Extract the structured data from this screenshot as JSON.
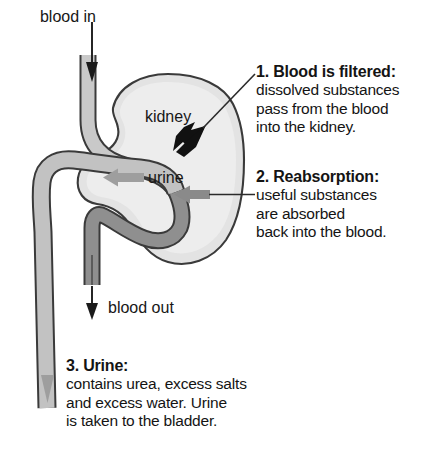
{
  "diagram": {
    "title_semantic": "kidney-blood-filtration-diagram",
    "labels": {
      "blood_in": "blood in",
      "blood_out": "blood out",
      "kidney": "kidney",
      "urine": "urine"
    },
    "colors": {
      "background": "#ffffff",
      "kidney_fill": "#e3e3e3",
      "kidney_inner_fill": "#ededed",
      "artery_fill": "#c9c9c9",
      "vein_fill": "#8f8f8f",
      "urine_tube_fill": "#c2c2c2",
      "outline": "#3a3a3a",
      "filter_arrow": "#111111",
      "reabsorption_arrow": "#8a8a8a",
      "urine_arrow": "#9e9e9e",
      "text": "#141414",
      "leader_line": "#2b2b2b"
    },
    "icons": {
      "blood_in_arrow": "arrow-down-icon",
      "blood_out_arrow": "arrow-down-icon",
      "urine_flow_arrow": "arrow-left-icon",
      "filtration_arrow": "arrow-up-right-icon",
      "reabsorption_arrow": "arrow-left-icon",
      "urine_outflow_arrow": "arrow-down-icon"
    }
  },
  "callouts": [
    {
      "id": "blood-filtered",
      "heading": "1. Blood is filtered:",
      "lines": [
        "dissolved substances",
        "pass from the blood",
        "into the kidney."
      ]
    },
    {
      "id": "reabsorption",
      "heading": "2. Reabsorption:",
      "lines": [
        "useful substances",
        "are absorbed",
        "back into the blood."
      ]
    },
    {
      "id": "urine",
      "heading": "3. Urine:",
      "lines": [
        "contains urea, excess salts",
        "and excess water. Urine",
        "is taken to the bladder."
      ]
    }
  ]
}
